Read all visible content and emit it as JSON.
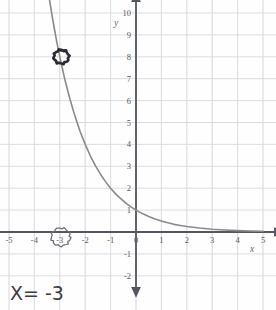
{
  "chart_data": {
    "type": "line",
    "title": "",
    "subtitle": "",
    "xlabel": "x",
    "ylabel": "y",
    "xlim": [
      -5,
      5
    ],
    "ylim": [
      -2,
      10
    ],
    "grid": true,
    "legend": null,
    "function_label": "y = 2^(-x)",
    "x_ticks": [
      "-5",
      "-4",
      "-3",
      "-2",
      "-1",
      "0",
      "1",
      "2",
      "3",
      "4",
      "5"
    ],
    "x_tick_values": [
      -5,
      -4,
      -3,
      -2,
      -1,
      0,
      1,
      2,
      3,
      4,
      5
    ],
    "y_ticks": [
      "-2",
      "-1",
      "0",
      "1",
      "2",
      "3",
      "4",
      "5",
      "6",
      "7",
      "8",
      "9",
      "10"
    ],
    "y_tick_values": [
      -2,
      -1,
      0,
      1,
      2,
      3,
      4,
      5,
      6,
      7,
      8,
      9,
      10
    ],
    "series": [
      {
        "name": "curve",
        "color": "#8a8a8a",
        "x": [
          -3.45,
          -3.3,
          -3.2,
          -3.1,
          -3.0,
          -2.8,
          -2.6,
          -2.4,
          -2.2,
          -2.0,
          -1.8,
          -1.6,
          -1.4,
          -1.2,
          -1.0,
          -0.8,
          -0.6,
          -0.4,
          -0.2,
          0.0,
          0.25,
          0.5,
          0.75,
          1.0,
          1.25,
          1.5,
          1.75,
          2.0,
          2.5,
          3.0,
          3.5,
          4.0,
          4.5,
          5.0
        ],
        "y": [
          10.93,
          9.85,
          9.19,
          8.57,
          8.0,
          6.96,
          6.06,
          5.28,
          4.59,
          4.0,
          3.48,
          3.03,
          2.64,
          2.3,
          2.0,
          1.74,
          1.52,
          1.32,
          1.15,
          1.0,
          0.84,
          0.71,
          0.59,
          0.5,
          0.42,
          0.35,
          0.3,
          0.25,
          0.18,
          0.125,
          0.088,
          0.0625,
          0.044,
          0.031
        ]
      }
    ],
    "annotations": [
      {
        "name": "circled-point",
        "kind": "hand-circle",
        "at": [
          -3,
          8
        ],
        "color": "#2a2a33",
        "note": "circled intersection point (-3, 8)"
      },
      {
        "name": "circled-x-tick",
        "kind": "hand-circle",
        "at": [
          -3,
          0
        ],
        "color": "#5a5a62",
        "note": "circle around the -3 tick label on the x axis"
      },
      {
        "name": "handwritten-answer",
        "kind": "hand-text",
        "text": "X= -3",
        "at": [
          -4.5,
          -2.2
        ],
        "color": "#3b3b44"
      }
    ]
  },
  "axes": {
    "x_axis_name": "x",
    "y_axis_name": "y",
    "x_arrow_left": true,
    "x_arrow_right": true,
    "y_arrow_up": true,
    "y_arrow_down": true,
    "axis_color": "#55555d",
    "grid_color": "#d9d9de",
    "grid_minor_color": "#ebebef",
    "background": "#fefefe"
  },
  "handwriting": {
    "answer": "X= -3"
  }
}
